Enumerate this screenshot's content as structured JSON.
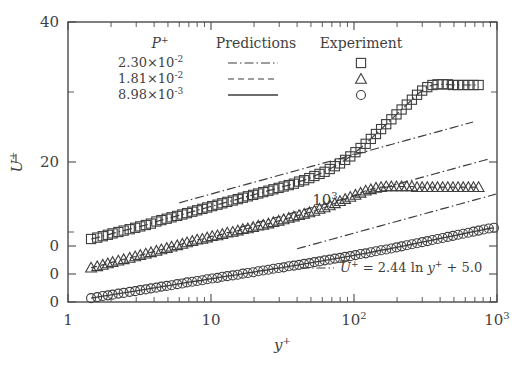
{
  "chart_data": {
    "type": "line",
    "title": "",
    "xlabel": "y+",
    "ylabel": "U+",
    "xlabel_display": "y",
    "xlabel_sup": "+",
    "ylabel_display": "U",
    "ylabel_sup": "+",
    "xscale": "log",
    "xlim": [
      1,
      1000
    ],
    "ylim": [
      0,
      40
    ],
    "grid": false,
    "legend_position": "top-center-inside",
    "x_tick_labels": [
      {
        "value": 1,
        "text": "1",
        "sup": ""
      },
      {
        "value": 10,
        "text": "10",
        "sup": ""
      },
      {
        "value": 100,
        "text": "10",
        "sup": "2"
      },
      {
        "value": 1000,
        "text": "10",
        "sup": "3"
      }
    ],
    "y_tick_labels": [
      {
        "value": 40,
        "text": "40"
      },
      {
        "value": 20,
        "text": "20"
      },
      {
        "value": 8,
        "text": "0"
      },
      {
        "value": 4,
        "text": "0"
      },
      {
        "value": 0,
        "text": "0"
      }
    ],
    "inline_labels": [
      {
        "text": "10",
        "sup": "3",
        "x": 325,
        "y": 205
      }
    ],
    "annotation": {
      "line_style": "dashdot",
      "text_parts": {
        "u": "U",
        "sup1": "+",
        "eq": "= 2.44 ln ",
        "y": "y",
        "sup2": "+",
        "tail": "+ 5.0"
      },
      "full_text": "U+ = 2.44 ln y+ + 5.0"
    },
    "legend": {
      "col_headers": [
        "P+",
        "Predictions",
        "Experiment"
      ],
      "col_header_main": "P",
      "col_header_sup": "+",
      "col_header_predictions": "Predictions",
      "col_header_experiment": "Experiment",
      "rows": [
        {
          "p_mantissa": "2.30",
          "p_times": "×10",
          "p_exponent": "-2",
          "line_style": "dashdot",
          "marker": "square"
        },
        {
          "p_mantissa": "1.81",
          "p_times": "×10",
          "p_exponent": "-2",
          "line_style": "dashed",
          "marker": "triangle"
        },
        {
          "p_mantissa": "8.98",
          "p_times": "×10",
          "p_exponent": "-3",
          "line_style": "solid",
          "marker": "circle"
        }
      ]
    },
    "series": [
      {
        "name": "2.30e-2",
        "marker": "square",
        "line_style": "dashdot",
        "offset": 8,
        "x": [
          1.45,
          1.6,
          1.75,
          1.9,
          2.05,
          2.25,
          2.45,
          2.7,
          2.95,
          3.2,
          3.5,
          3.8,
          4.15,
          4.5,
          4.9,
          5.3,
          5.8,
          6.3,
          6.8,
          7.4,
          8.0,
          8.7,
          9.4,
          10.2,
          11.1,
          12.0,
          13.0,
          14.2,
          15.4,
          16.7,
          18.1,
          19.7,
          21.4,
          23.2,
          25.2,
          27.3,
          29.7,
          32.2,
          35.0,
          38.0,
          41.3,
          44.8,
          48.7,
          52.8,
          57.4,
          62.3,
          67.7,
          73.5,
          79.8,
          86.7,
          94.2,
          102.3,
          111.1,
          120.7,
          131.1,
          142.4,
          154.7,
          168.0,
          182.5,
          198.2,
          215.3,
          233.9,
          254.0,
          275.9,
          299.7,
          325.5,
          353.5,
          384.0,
          417.1,
          453.0,
          492.1,
          534.5,
          580.6,
          630.6,
          684.9,
          743.9
        ],
        "y": [
          1.0,
          1.2,
          1.4,
          1.6,
          1.8,
          2.0,
          2.2,
          2.4,
          2.6,
          2.8,
          3.0,
          3.2,
          3.5,
          3.7,
          3.9,
          4.1,
          4.3,
          4.5,
          4.7,
          4.9,
          5.1,
          5.3,
          5.5,
          5.7,
          5.9,
          6.1,
          6.3,
          6.5,
          6.7,
          6.9,
          7.1,
          7.3,
          7.5,
          7.7,
          7.9,
          8.1,
          8.3,
          8.5,
          8.7,
          8.9,
          9.2,
          9.4,
          9.7,
          10.0,
          10.3,
          10.6,
          11.0,
          11.4,
          11.8,
          12.3,
          12.8,
          13.4,
          14.0,
          14.6,
          15.3,
          16.0,
          16.7,
          17.4,
          18.1,
          18.8,
          19.5,
          20.2,
          20.9,
          21.6,
          22.2,
          22.7,
          23.0,
          23.1,
          23.1,
          23.1,
          23.0,
          23.0,
          23.0,
          23.0,
          23.0,
          23.0
        ]
      },
      {
        "name": "1.81e-2",
        "marker": "triangle",
        "line_style": "dashed",
        "offset": 4,
        "x": [
          1.45,
          1.6,
          1.75,
          1.9,
          2.05,
          2.25,
          2.45,
          2.7,
          2.95,
          3.2,
          3.5,
          3.8,
          4.15,
          4.5,
          4.9,
          5.3,
          5.8,
          6.3,
          6.8,
          7.4,
          8.0,
          8.7,
          9.4,
          10.2,
          11.1,
          12.0,
          13.0,
          14.2,
          15.4,
          16.7,
          18.1,
          19.7,
          21.4,
          23.2,
          25.2,
          27.3,
          29.7,
          32.2,
          35.0,
          38.0,
          41.3,
          44.8,
          48.7,
          52.8,
          57.4,
          62.3,
          67.7,
          73.5,
          79.8,
          86.7,
          94.2,
          102.3,
          111.1,
          120.7,
          131.1,
          142.4,
          154.7,
          168.0,
          182.5,
          198.2,
          215.3,
          233.9,
          254.0,
          275.9,
          299.7,
          325.5,
          353.5,
          384.0,
          417.1,
          453.0,
          492.1,
          534.5,
          580.6,
          630.6,
          684.9,
          743.9
        ],
        "y": [
          0.9,
          1.1,
          1.3,
          1.5,
          1.7,
          1.9,
          2.1,
          2.3,
          2.5,
          2.7,
          2.9,
          3.1,
          3.3,
          3.5,
          3.7,
          3.9,
          4.1,
          4.3,
          4.5,
          4.7,
          4.9,
          5.0,
          5.2,
          5.4,
          5.5,
          5.7,
          5.9,
          6.0,
          6.2,
          6.4,
          6.5,
          6.7,
          6.9,
          7.0,
          7.2,
          7.4,
          7.6,
          7.8,
          8.0,
          8.2,
          8.4,
          8.6,
          8.8,
          9.0,
          9.3,
          9.5,
          9.8,
          10.1,
          10.4,
          10.7,
          11.0,
          11.3,
          11.6,
          11.9,
          12.1,
          12.3,
          12.4,
          12.5,
          12.5,
          12.5,
          12.5,
          12.5,
          12.5,
          12.4,
          12.4,
          12.4,
          12.4,
          12.4,
          12.4,
          12.4,
          12.4,
          12.4,
          12.4,
          12.4,
          12.4,
          12.4
        ]
      },
      {
        "name": "8.98e-3",
        "marker": "circle",
        "line_style": "solid",
        "offset": 0,
        "x": [
          1.45,
          1.6,
          1.75,
          1.9,
          2.05,
          2.25,
          2.45,
          2.7,
          2.95,
          3.2,
          3.5,
          3.8,
          4.15,
          4.5,
          4.9,
          5.3,
          5.8,
          6.3,
          6.8,
          7.4,
          8.0,
          8.7,
          9.4,
          10.2,
          11.1,
          12.0,
          13.0,
          14.2,
          15.4,
          16.7,
          18.1,
          19.7,
          21.4,
          23.2,
          25.2,
          27.3,
          29.7,
          32.2,
          35.0,
          38.0,
          41.3,
          44.8,
          48.7,
          52.8,
          57.4,
          62.3,
          67.7,
          73.5,
          79.8,
          86.7,
          94.2,
          102.3,
          111.1,
          120.7,
          131.1,
          142.4,
          154.7,
          168.0,
          182.5,
          198.2,
          215.3,
          233.9,
          254.0,
          275.9,
          299.7,
          325.5,
          353.5,
          384.0,
          417.1,
          453.0,
          492.1,
          534.5,
          580.6,
          630.6,
          684.9,
          743.9,
          808.0,
          877.0,
          952.0
        ],
        "y": [
          0.55,
          0.7,
          0.85,
          0.95,
          1.05,
          1.2,
          1.3,
          1.45,
          1.55,
          1.7,
          1.8,
          1.95,
          2.05,
          2.2,
          2.3,
          2.4,
          2.55,
          2.65,
          2.8,
          2.9,
          3.0,
          3.1,
          3.25,
          3.35,
          3.45,
          3.6,
          3.7,
          3.8,
          3.9,
          4.05,
          4.15,
          4.25,
          4.4,
          4.5,
          4.6,
          4.75,
          4.85,
          4.95,
          5.1,
          5.2,
          5.3,
          5.45,
          5.55,
          5.7,
          5.8,
          5.95,
          6.05,
          6.2,
          6.3,
          6.45,
          6.55,
          6.7,
          6.85,
          6.95,
          7.1,
          7.25,
          7.4,
          7.5,
          7.65,
          7.8,
          7.95,
          8.1,
          8.25,
          8.4,
          8.55,
          8.7,
          8.85,
          9.0,
          9.15,
          9.3,
          9.45,
          9.6,
          9.75,
          9.9,
          10.05,
          10.2,
          10.35,
          10.5,
          10.6
        ]
      }
    ],
    "reference_lines": [
      {
        "name": "loglaw-upper",
        "style": "dashdot",
        "offset": 8,
        "x_start": 6.0,
        "x_end": 680.0,
        "slope": 2.44,
        "intercept": 5.0,
        "shift": -3.2
      },
      {
        "name": "loglaw-middle",
        "style": "dashdot",
        "offset": 4,
        "x_start": 16.0,
        "x_end": 900.0,
        "slope": 2.44,
        "intercept": 5.0,
        "shift": -5.1
      },
      {
        "name": "loglaw-lower",
        "style": "dashdot",
        "offset": 0,
        "x_start": 40.0,
        "x_end": 980.0,
        "slope": 2.44,
        "intercept": 5.0,
        "shift": -6.4
      }
    ]
  }
}
